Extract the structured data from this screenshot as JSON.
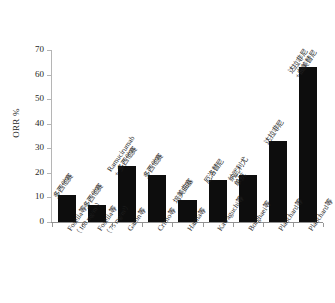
{
  "chart_data": {
    "type": "bar",
    "title": "",
    "subtitle": "",
    "xlabel": "",
    "ylabel": "ORR %",
    "ylim": [
      0,
      70
    ],
    "yticks": [
      0,
      10,
      20,
      30,
      40,
      50,
      60,
      70
    ],
    "grid": false,
    "legend": "none",
    "bar_color": "#0d0d0d",
    "categories": [
      "Fosella等\n（100 mg/m²）",
      "Fosella等\n（75 mg/m²）",
      "Garon等",
      "Crimo等",
      "Hanna等",
      "Kawaguchi等",
      "Borghaei等",
      "Planchard等",
      "Planchard等"
    ],
    "category_labels": [
      {
        "name": "Fosella等",
        "sub": "（100 mg/m³）"
      },
      {
        "name": "Fosella等",
        "sub": "（75 mg/m³）"
      },
      {
        "name": "Garon等",
        "sub": ""
      },
      {
        "name": "Crimo等",
        "sub": ""
      },
      {
        "name": "Hanna等",
        "sub": ""
      },
      {
        "name": "Kawaguchi等",
        "sub": ""
      },
      {
        "name": "Borghaei等",
        "sub": ""
      },
      {
        "name": "Planchard等",
        "sub": ""
      },
      {
        "name": "Planchard等",
        "sub": ""
      }
    ],
    "point_annotations": [
      {
        "line1": "多西他赛",
        "line2": ""
      },
      {
        "line1": "多西他赛",
        "line2": ""
      },
      {
        "line1": "Ramucirumab",
        "line2": "+ 多西他赛"
      },
      {
        "line1": "多西他赛",
        "line2": ""
      },
      {
        "line1": "培美曲塞",
        "line2": ""
      },
      {
        "line1": "厄洛替尼",
        "line2": ""
      },
      {
        "line1": "纳武利尤",
        "line2": "单抗"
      },
      {
        "line1": "达拉非尼",
        "line2": ""
      },
      {
        "line1": "达拉非尼",
        "line2": "+曲美替尼"
      }
    ],
    "values": [
      11,
      7,
      23,
      19,
      9,
      17,
      19,
      33,
      63
    ]
  }
}
